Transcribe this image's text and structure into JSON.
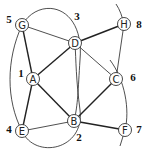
{
  "nodes": [
    {
      "id": "G",
      "label": "G",
      "number": "5",
      "x": 22,
      "y": 25,
      "nx": 9,
      "ny": 19
    },
    {
      "id": "D",
      "label": "D",
      "number": "3",
      "x": 75,
      "y": 43,
      "nx": 77,
      "ny": 16
    },
    {
      "id": "H",
      "label": "H",
      "number": "8",
      "x": 124,
      "y": 24,
      "nx": 139,
      "ny": 24
    },
    {
      "id": "A",
      "label": "A",
      "number": "1",
      "x": 33,
      "y": 79,
      "nx": 21,
      "ny": 73
    },
    {
      "id": "C",
      "label": "C",
      "number": "6",
      "x": 116,
      "y": 79,
      "nx": 133,
      "ny": 77
    },
    {
      "id": "E",
      "label": "E",
      "number": "4",
      "x": 22,
      "y": 131,
      "nx": 9,
      "ny": 129
    },
    {
      "id": "B",
      "label": "B",
      "number": "2",
      "x": 74,
      "y": 121,
      "nx": 79,
      "ny": 137
    },
    {
      "id": "F",
      "label": "F",
      "number": "7",
      "x": 125,
      "y": 130,
      "nx": 139,
      "ny": 129
    }
  ],
  "edges": [
    {
      "from": "G",
      "to": "D",
      "style": "thin"
    },
    {
      "from": "G",
      "to": "A",
      "style": "thick"
    },
    {
      "from": "D",
      "to": "H",
      "style": "thick"
    },
    {
      "from": "D",
      "to": "A",
      "style": "thick"
    },
    {
      "from": "D",
      "to": "C",
      "style": "thin"
    },
    {
      "from": "A",
      "to": "E",
      "style": "thick"
    },
    {
      "from": "A",
      "to": "B",
      "style": "thick"
    },
    {
      "from": "E",
      "to": "B",
      "style": "thin"
    },
    {
      "from": "B",
      "to": "C",
      "style": "thick"
    },
    {
      "from": "B",
      "to": "F",
      "style": "thick"
    },
    {
      "from": "H",
      "to": "C",
      "style": "thin"
    }
  ],
  "curves": [
    {
      "name": "arc-g-e",
      "d": "M22,25 C6,60 6,100 22,131"
    },
    {
      "name": "arc-g-b",
      "d": "M22,25 C40,-5 85,5 80,60 C78,90 78,105 74,121"
    },
    {
      "name": "arc-e-d",
      "d": "M22,131 C35,160 85,150 80,110 C76,80 76,60 75,43"
    },
    {
      "name": "arc-c-f",
      "d": "M110,60 C125,80 130,110 125,130"
    },
    {
      "name": "tick-h",
      "d": "M116,4 C120,10 122,16 124,24"
    },
    {
      "name": "tail-f",
      "d": "M125,130 L120,146"
    }
  ]
}
